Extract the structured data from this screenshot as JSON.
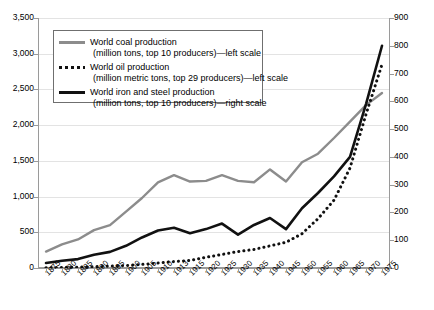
{
  "chart_data": {
    "type": "line",
    "title": "",
    "xlabel": "",
    "ylabel": "",
    "grid": true,
    "legend_position": "top-left-inside",
    "categories": [
      "1875",
      "1880",
      "1885",
      "1890",
      "1895",
      "1900",
      "1905",
      "1910",
      "1913",
      "1915",
      "1920",
      "1925",
      "1930",
      "1935",
      "1940",
      "1945",
      "1950",
      "1955",
      "1960",
      "1965",
      "1970",
      "1975"
    ],
    "left_axis": {
      "label": "left scale",
      "min": 0,
      "max": 3500,
      "step": 500,
      "ticks": [
        "0",
        "500",
        "1,000",
        "1,500",
        "2,000",
        "2,500",
        "3,000",
        "3,500"
      ]
    },
    "right_axis": {
      "label": "right scale",
      "min": 0,
      "max": 900,
      "step": 100,
      "ticks": [
        "0",
        "100",
        "200",
        "300",
        "400",
        "500",
        "600",
        "700",
        "800",
        "900"
      ]
    },
    "series": [
      {
        "name": "World coal production",
        "detail": "(million tons, top 10 producers)—left scale",
        "line1": "World coal production",
        "line2": "(million tons, top 10 producers)—left scale",
        "axis": "left",
        "style": "solid",
        "color": "#8c8c8c",
        "values": [
          230,
          330,
          400,
          530,
          600,
          790,
          980,
          1200,
          1300,
          1210,
          1220,
          1300,
          1220,
          1200,
          1380,
          1210,
          1480,
          1600,
          1820,
          2050,
          2280,
          2450
        ]
      },
      {
        "name": "World oil production",
        "detail": "(million metric tons, top 29 producers)—left scale",
        "line1": "World oil production",
        "line2": "(million metric tons, top 29 producers)—left scale",
        "axis": "left",
        "style": "dotted",
        "color": "#111111",
        "values": [
          5,
          8,
          12,
          18,
          25,
          35,
          50,
          70,
          90,
          105,
          150,
          190,
          230,
          260,
          310,
          360,
          480,
          690,
          950,
          1400,
          2150,
          2850
        ]
      },
      {
        "name": "World iron and steel production",
        "detail": "(million tons, top 10 producers)—right scale",
        "line1": "World iron and steel production",
        "line2": "(million tons, top 10 producers)—right scale",
        "axis": "right",
        "style": "solid-bold",
        "color": "#111111",
        "values": [
          18,
          26,
          32,
          48,
          58,
          80,
          110,
          135,
          145,
          125,
          140,
          160,
          120,
          155,
          180,
          140,
          215,
          270,
          330,
          400,
          590,
          800
        ]
      }
    ]
  }
}
